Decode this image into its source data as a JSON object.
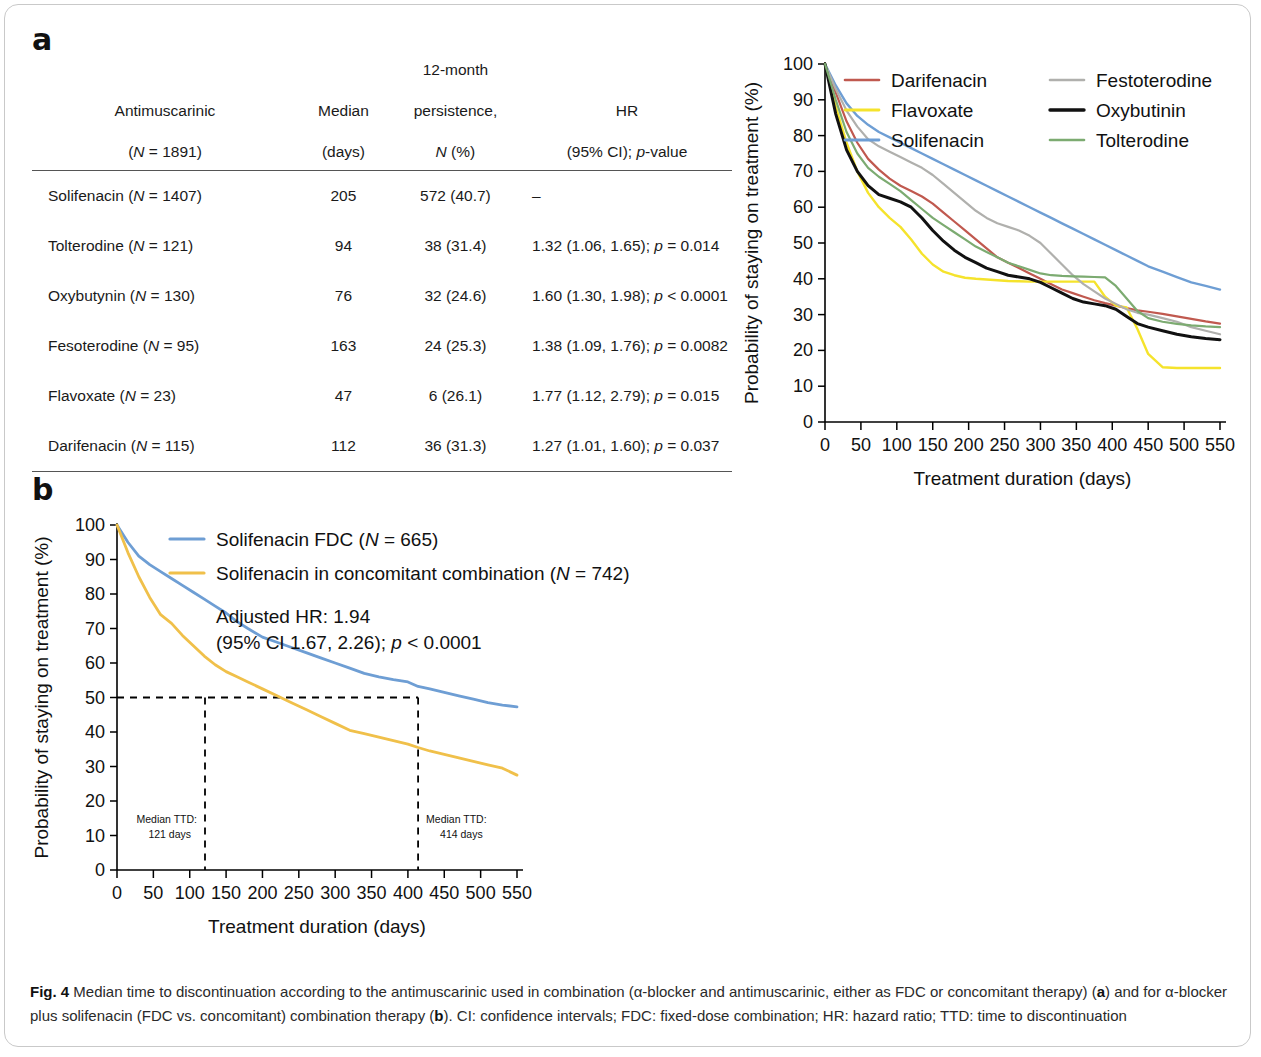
{
  "panels": {
    "a_label": "a",
    "b_label": "b"
  },
  "table": {
    "headers": [
      "Antimuscarinic\n(N = 1891)",
      "Median\n(days)",
      "12-month\npersistence,\nN (%)",
      "HR\n(95% CI); p-value"
    ],
    "header_parts": {
      "c1_l1": "Antimuscarinic",
      "c1_l2a": "(",
      "c1_l2i": "N",
      "c1_l2b": " = 1891)",
      "c2_l1": "Median",
      "c2_l2": "(days)",
      "c3_l1": "12-month",
      "c3_l2": "persistence,",
      "c3_l3a": "N",
      "c3_l3b": " (%)",
      "c4_l1": "HR",
      "c4_l2a": "(95% CI); ",
      "c4_l2i": "p",
      "c4_l2b": "-value"
    },
    "rows": [
      {
        "drug": "Solifenacin",
        "n": "(N = 1407)",
        "median": "205",
        "persistence": "572 (40.7)",
        "hr": "–"
      },
      {
        "drug": "Tolterodine",
        "n": "(N = 121)",
        "median": "94",
        "persistence": "38 (31.4)",
        "hr": "1.32 (1.06, 1.65); p = 0.014"
      },
      {
        "drug": "Oxybutynin",
        "n": "(N = 130)",
        "median": "76",
        "persistence": "32 (24.6)",
        "hr": "1.60 (1.30, 1.98); p < 0.0001"
      },
      {
        "drug": "Fesoterodine",
        "n": "(N = 95)",
        "median": "163",
        "persistence": "24 (25.3)",
        "hr": "1.38 (1.09, 1.76); p = 0.0082"
      },
      {
        "drug": "Flavoxate",
        "n": "(N = 23)",
        "median": "47",
        "persistence": "6 (26.1)",
        "hr": "1.77 (1.12, 2.79); p = 0.015"
      },
      {
        "drug": "Darifenacin",
        "n": "(N = 115)",
        "median": "112",
        "persistence": "36 (31.3)",
        "hr": "1.27 (1.01, 1.60); p = 0.037"
      }
    ]
  },
  "chart_data": [
    {
      "id": "panel-a",
      "type": "line",
      "title": "",
      "xlabel": "Treatment duration (days)",
      "ylabel": "Probability of staying on treatment (%)",
      "xlim": [
        0,
        550
      ],
      "ylim": [
        0,
        100
      ],
      "xticks": [
        0,
        50,
        100,
        150,
        200,
        250,
        300,
        350,
        400,
        450,
        500,
        550
      ],
      "yticks": [
        0,
        10,
        20,
        30,
        40,
        50,
        60,
        70,
        80,
        90,
        100
      ],
      "grid": false,
      "legend_position": "top-right",
      "legend_columns": 2,
      "x": [
        0,
        15,
        30,
        45,
        60,
        75,
        90,
        105,
        120,
        135,
        150,
        165,
        180,
        195,
        210,
        225,
        240,
        255,
        270,
        285,
        300,
        315,
        330,
        345,
        360,
        375,
        390,
        405,
        420,
        435,
        450,
        470,
        490,
        510,
        530,
        550
      ],
      "series": [
        {
          "name": "Darifenacin",
          "color": "#c0594f",
          "width": 2.2,
          "values": [
            100,
            92,
            84,
            78,
            73.5,
            70.5,
            68,
            66,
            64.5,
            63,
            61,
            58.5,
            56,
            53.5,
            51,
            48.5,
            46,
            44.5,
            43,
            41.5,
            40,
            38.5,
            37,
            36,
            35,
            34,
            33.2,
            32.5,
            31.8,
            31.2,
            30.8,
            30.2,
            29.5,
            28.8,
            28.1,
            27.5
          ]
        },
        {
          "name": "Flavoxate",
          "color": "#f5e32c",
          "width": 2.4,
          "values": [
            100,
            88,
            78,
            70,
            64,
            60,
            57,
            54.5,
            51,
            47,
            44,
            42,
            41,
            40.3,
            40,
            39.8,
            39.6,
            39.4,
            39.3,
            39.2,
            39.2,
            39.2,
            39.2,
            39.2,
            39.2,
            39.2,
            35,
            32.5,
            32,
            26,
            19,
            15.3,
            15.1,
            15.1,
            15.1,
            15.1
          ]
        },
        {
          "name": "Solifenacin",
          "color": "#6e9ed4",
          "width": 2.4,
          "values": [
            100,
            94,
            89,
            85.5,
            83,
            81,
            79.5,
            78,
            76.5,
            75,
            73.5,
            72,
            70.5,
            69,
            67.5,
            66,
            64.5,
            63,
            61.5,
            60,
            58.5,
            57,
            55.5,
            54,
            52.5,
            51,
            49.5,
            48,
            46.5,
            45,
            43.5,
            42,
            40.5,
            39,
            38,
            37
          ]
        },
        {
          "name": "Festoterodine",
          "color": "#b0b0ad",
          "width": 2.2,
          "values": [
            100,
            93,
            87,
            82.5,
            79,
            77,
            75.5,
            74,
            72.5,
            71,
            69,
            66.5,
            64,
            61.5,
            59,
            57,
            55.5,
            54.5,
            53.5,
            52,
            50,
            47,
            44,
            41,
            38.5,
            36.5,
            34.5,
            33,
            31.5,
            30.5,
            30,
            29,
            28,
            26.5,
            25.5,
            24.5
          ]
        },
        {
          "name": "Oxybutinin",
          "color": "#111111",
          "width": 3.0,
          "values": [
            100,
            86,
            76,
            70,
            66,
            63.5,
            62.5,
            61.5,
            60,
            57,
            53.5,
            50.5,
            48,
            46,
            44.5,
            43,
            42,
            41,
            40.5,
            40,
            39,
            37.5,
            36,
            34.5,
            33.5,
            33,
            32.5,
            31.5,
            29.5,
            27.5,
            26.5,
            25.5,
            24.5,
            23.8,
            23.3,
            23
          ]
        },
        {
          "name": "Tolterodine",
          "color": "#7cab71",
          "width": 2.2,
          "values": [
            100,
            90,
            81,
            75,
            71,
            68.5,
            66.5,
            64.5,
            62,
            59.5,
            57,
            55,
            53,
            51,
            49,
            47.5,
            46,
            44.5,
            43.5,
            42.5,
            41.5,
            41,
            40.8,
            40.7,
            40.6,
            40.5,
            40.4,
            38,
            34.5,
            31,
            29,
            28,
            27.4,
            27,
            26.7,
            26.5
          ]
        }
      ]
    },
    {
      "id": "panel-b",
      "type": "line",
      "title": "",
      "xlabel": "Treatment duration (days)",
      "ylabel": "Probability of staying on treatment (%)",
      "xlim": [
        0,
        550
      ],
      "ylim": [
        0,
        100
      ],
      "xticks": [
        0,
        50,
        100,
        150,
        200,
        250,
        300,
        350,
        400,
        450,
        500,
        550
      ],
      "yticks": [
        0,
        10,
        20,
        30,
        40,
        50,
        60,
        70,
        80,
        90,
        100
      ],
      "grid": false,
      "legend_position": "top-center",
      "legend_columns": 1,
      "x": [
        0,
        15,
        30,
        45,
        60,
        75,
        90,
        105,
        120,
        135,
        150,
        165,
        180,
        200,
        220,
        240,
        260,
        280,
        300,
        320,
        340,
        360,
        380,
        400,
        414,
        430,
        450,
        470,
        490,
        510,
        530,
        550
      ],
      "series": [
        {
          "name": "Solifenacin FDC (N = 665)",
          "color": "#6e9ed4",
          "width": 2.8,
          "values": [
            100,
            95,
            91,
            88.5,
            86.5,
            84.5,
            82.5,
            80.5,
            78.5,
            76.5,
            74.5,
            72,
            70,
            67.5,
            66,
            64.5,
            63,
            61.5,
            60,
            58.5,
            57,
            56,
            55.2,
            54.5,
            53.2,
            52.5,
            51.5,
            50.5,
            49.5,
            48.5,
            47.8,
            47.3
          ]
        },
        {
          "name": "Solifenacin in concomitant combination (N = 742)",
          "color": "#f0c04a",
          "width": 2.8,
          "values": [
            100,
            92,
            85,
            79,
            74,
            71.5,
            68,
            65,
            62,
            59.5,
            57.5,
            56,
            54.5,
            52.5,
            50.5,
            48.5,
            46.5,
            44.5,
            42.5,
            40.5,
            39.5,
            38.5,
            37.5,
            36.5,
            35.5,
            34.5,
            33.5,
            32.5,
            31.5,
            30.5,
            29.5,
            27.5
          ]
        }
      ],
      "reference_line": {
        "y": 50,
        "x_from": 0,
        "x_to": 414
      },
      "markers": [
        {
          "x": 121,
          "label_line1": "Median TTD:",
          "label_line2": "121 days",
          "side": "left"
        },
        {
          "x": 414,
          "label_line1": "Median TTD:",
          "label_line2": "414 days",
          "side": "right"
        }
      ],
      "annotations": [
        {
          "line1": "Adjusted HR: 1.94",
          "line2": "(95% CI 1.67, 2.26); p < 0.0001"
        }
      ]
    }
  ],
  "caption": {
    "bold_prefix": "Fig. 4",
    "text_1": " Median time to discontinuation according to the antimuscarinic used in combination (α-blocker and antimuscarinic, either as FDC or concomitant therapy) (",
    "bold_a": "a",
    "text_2": ") and for α-blocker plus solifenacin (FDC vs. concomitant) combination therapy (",
    "bold_b": "b",
    "text_3": "). CI: confidence intervals; FDC: fixed-dose combination; HR: hazard ratio; TTD: time to discontinuation"
  }
}
